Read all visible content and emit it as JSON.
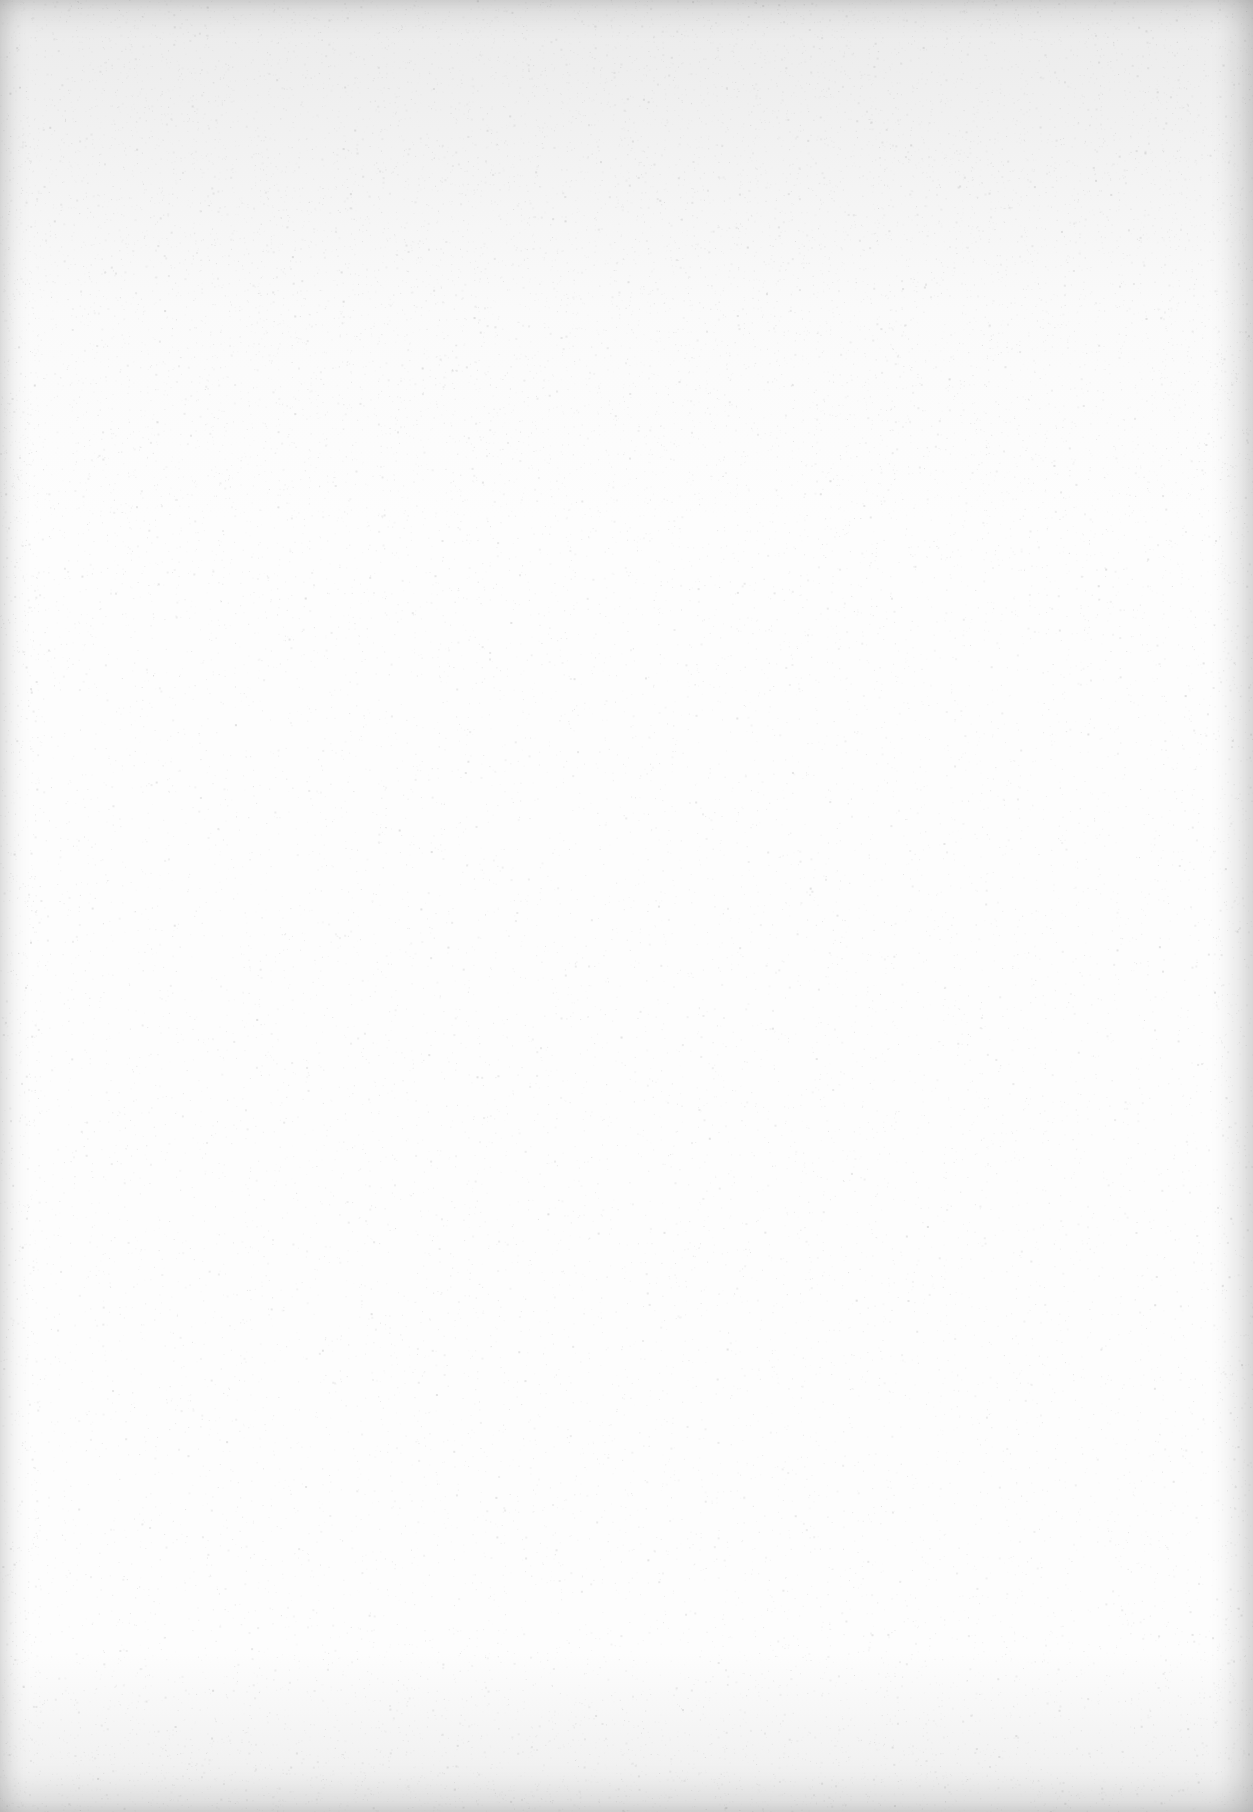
{
  "document": {
    "type": "blank-scanned-page",
    "text_content": [],
    "colors": {
      "paper": "#fdfdfd",
      "edge_shadow": "#e9e9e9",
      "speckle": "#c8c8c8"
    }
  }
}
